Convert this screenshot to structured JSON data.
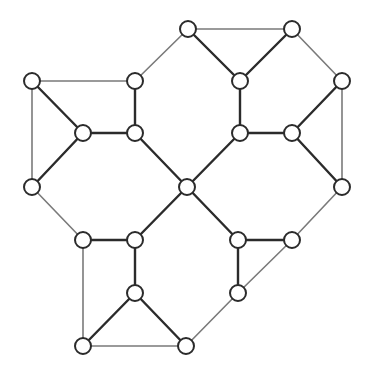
{
  "diagram": {
    "type": "graph",
    "node_radius": 8,
    "colors": {
      "background": "#ffffff",
      "node_fill": "#ffffff",
      "node_stroke": "#2b2b2b",
      "edge_thick": "#2b2b2b",
      "edge_thin": "#7a7a7a"
    },
    "nodes": [
      {
        "id": "n1",
        "x": 188,
        "y": 29
      },
      {
        "id": "n2",
        "x": 292,
        "y": 29
      },
      {
        "id": "n3",
        "x": 32,
        "y": 81
      },
      {
        "id": "n4",
        "x": 135,
        "y": 81
      },
      {
        "id": "n5",
        "x": 240,
        "y": 81
      },
      {
        "id": "n6",
        "x": 342,
        "y": 81
      },
      {
        "id": "n7",
        "x": 83,
        "y": 133
      },
      {
        "id": "n8",
        "x": 135,
        "y": 133
      },
      {
        "id": "n9",
        "x": 240,
        "y": 133
      },
      {
        "id": "n10",
        "x": 292,
        "y": 133
      },
      {
        "id": "n11",
        "x": 32,
        "y": 187
      },
      {
        "id": "n12",
        "x": 187,
        "y": 187
      },
      {
        "id": "n13",
        "x": 342,
        "y": 187
      },
      {
        "id": "n14",
        "x": 83,
        "y": 240
      },
      {
        "id": "n15",
        "x": 135,
        "y": 240
      },
      {
        "id": "n16",
        "x": 238,
        "y": 240
      },
      {
        "id": "n17",
        "x": 292,
        "y": 240
      },
      {
        "id": "n18",
        "x": 135,
        "y": 293
      },
      {
        "id": "n19",
        "x": 238,
        "y": 293
      },
      {
        "id": "n20",
        "x": 83,
        "y": 346
      },
      {
        "id": "n21",
        "x": 186,
        "y": 346
      }
    ],
    "edges": [
      {
        "from": "n1",
        "to": "n2",
        "style": "thin"
      },
      {
        "from": "n1",
        "to": "n5",
        "style": "thick"
      },
      {
        "from": "n2",
        "to": "n5",
        "style": "thick"
      },
      {
        "from": "n1",
        "to": "n4",
        "style": "thin"
      },
      {
        "from": "n2",
        "to": "n6",
        "style": "thin"
      },
      {
        "from": "n3",
        "to": "n4",
        "style": "thin"
      },
      {
        "from": "n3",
        "to": "n7",
        "style": "thick"
      },
      {
        "from": "n3",
        "to": "n11",
        "style": "thin"
      },
      {
        "from": "n4",
        "to": "n8",
        "style": "thick"
      },
      {
        "from": "n7",
        "to": "n8",
        "style": "thick"
      },
      {
        "from": "n5",
        "to": "n9",
        "style": "thick"
      },
      {
        "from": "n9",
        "to": "n10",
        "style": "thick"
      },
      {
        "from": "n6",
        "to": "n10",
        "style": "thick"
      },
      {
        "from": "n6",
        "to": "n13",
        "style": "thin"
      },
      {
        "from": "n7",
        "to": "n11",
        "style": "thick"
      },
      {
        "from": "n8",
        "to": "n12",
        "style": "thick"
      },
      {
        "from": "n9",
        "to": "n12",
        "style": "thick"
      },
      {
        "from": "n10",
        "to": "n13",
        "style": "thick"
      },
      {
        "from": "n11",
        "to": "n14",
        "style": "thin"
      },
      {
        "from": "n12",
        "to": "n15",
        "style": "thick"
      },
      {
        "from": "n12",
        "to": "n16",
        "style": "thick"
      },
      {
        "from": "n13",
        "to": "n17",
        "style": "thin"
      },
      {
        "from": "n14",
        "to": "n15",
        "style": "thick"
      },
      {
        "from": "n16",
        "to": "n17",
        "style": "thick"
      },
      {
        "from": "n14",
        "to": "n20",
        "style": "thin"
      },
      {
        "from": "n15",
        "to": "n18",
        "style": "thick"
      },
      {
        "from": "n16",
        "to": "n19",
        "style": "thick"
      },
      {
        "from": "n17",
        "to": "n19",
        "style": "thin"
      },
      {
        "from": "n18",
        "to": "n20",
        "style": "thick"
      },
      {
        "from": "n18",
        "to": "n21",
        "style": "thick"
      },
      {
        "from": "n20",
        "to": "n21",
        "style": "thin"
      },
      {
        "from": "n19",
        "to": "n21",
        "style": "thin"
      }
    ]
  }
}
